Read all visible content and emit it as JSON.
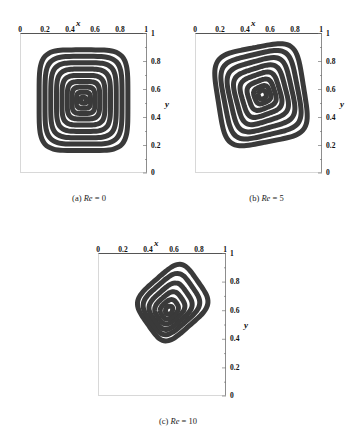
{
  "figure": {
    "panels": [
      {
        "id": "a",
        "caption_prefix": "(a)",
        "caption_symbol": "Re",
        "caption_value": "= 0",
        "caption_full": "(a) Re = 0",
        "x_axis_label": "x",
        "y_axis_label": "y",
        "x_ticks": [
          "0",
          "0.2",
          "0.4",
          "0.6",
          "0.8",
          "1"
        ],
        "y_ticks": [
          "1",
          "0.8",
          "0.6",
          "0.4",
          "0.2",
          "0"
        ]
      },
      {
        "id": "b",
        "caption_prefix": "(b)",
        "caption_symbol": "Re",
        "caption_value": "= 5",
        "caption_full": "(b) Re = 5",
        "x_axis_label": "x",
        "y_axis_label": "y",
        "x_ticks": [
          "0",
          "0.2",
          "0.4",
          "0.6",
          "0.8",
          "1"
        ],
        "y_ticks": [
          "1",
          "0.8",
          "0.6",
          "0.4",
          "0.2",
          "0"
        ]
      },
      {
        "id": "c",
        "caption_prefix": "(c)",
        "caption_symbol": "Re",
        "caption_value": "= 10",
        "caption_full": "(c) Re = 10",
        "x_axis_label": "x",
        "y_axis_label": "y",
        "x_ticks": [
          "0",
          "0.2",
          "0.4",
          "0.6",
          "0.8",
          "1"
        ],
        "y_ticks": [
          "1",
          "0.8",
          "0.6",
          "0.4",
          "0.2",
          "0"
        ]
      }
    ]
  },
  "chart_data": [
    {
      "type": "contour",
      "title": "(a) Re = 0",
      "xlabel": "x",
      "ylabel": "y",
      "xlim": [
        0,
        1
      ],
      "ylim": [
        0,
        1
      ],
      "xticks": [
        0,
        0.2,
        0.4,
        0.6,
        0.8,
        1
      ],
      "yticks": [
        0,
        0.2,
        0.4,
        0.6,
        0.8,
        1
      ],
      "grid": false,
      "legend": "none",
      "vortex_center": [
        0.5,
        0.52
      ],
      "n_contours": 9,
      "contours": [
        {
          "level": 1,
          "cx": 0.5,
          "cy": 0.52,
          "rx": 0.355,
          "ry": 0.365,
          "rot": 0,
          "squareness": 0.74
        },
        {
          "level": 2,
          "cx": 0.5,
          "cy": 0.52,
          "rx": 0.308,
          "ry": 0.318,
          "rot": 0,
          "squareness": 0.7
        },
        {
          "level": 3,
          "cx": 0.5,
          "cy": 0.52,
          "rx": 0.262,
          "ry": 0.272,
          "rot": 0,
          "squareness": 0.66
        },
        {
          "level": 4,
          "cx": 0.5,
          "cy": 0.52,
          "rx": 0.216,
          "ry": 0.226,
          "rot": 0,
          "squareness": 0.62
        },
        {
          "level": 5,
          "cx": 0.5,
          "cy": 0.52,
          "rx": 0.172,
          "ry": 0.18,
          "rot": 0,
          "squareness": 0.58
        },
        {
          "level": 6,
          "cx": 0.5,
          "cy": 0.52,
          "rx": 0.13,
          "ry": 0.136,
          "rot": 0,
          "squareness": 0.54
        },
        {
          "level": 7,
          "cx": 0.5,
          "cy": 0.52,
          "rx": 0.092,
          "ry": 0.096,
          "rot": 0,
          "squareness": 0.5
        },
        {
          "level": 8,
          "cx": 0.5,
          "cy": 0.52,
          "rx": 0.056,
          "ry": 0.058,
          "rot": 0,
          "squareness": 0.44
        },
        {
          "level": 9,
          "cx": 0.5,
          "cy": 0.52,
          "rx": 0.024,
          "ry": 0.026,
          "rot": 45,
          "squareness": 0.0
        }
      ]
    },
    {
      "type": "contour",
      "title": "(b) Re = 5",
      "xlabel": "x",
      "ylabel": "y",
      "xlim": [
        0,
        1
      ],
      "ylim": [
        0,
        1
      ],
      "xticks": [
        0,
        0.2,
        0.4,
        0.6,
        0.8,
        1
      ],
      "yticks": [
        0,
        0.2,
        0.4,
        0.6,
        0.8,
        1
      ],
      "grid": false,
      "legend": "none",
      "vortex_center": [
        0.53,
        0.56
      ],
      "n_contours": 8,
      "contours": [
        {
          "level": 1,
          "cx": 0.52,
          "cy": 0.56,
          "rx": 0.345,
          "ry": 0.345,
          "rot": 10,
          "squareness": 0.72
        },
        {
          "level": 2,
          "cx": 0.52,
          "cy": 0.56,
          "rx": 0.296,
          "ry": 0.296,
          "rot": 12,
          "squareness": 0.68
        },
        {
          "level": 3,
          "cx": 0.52,
          "cy": 0.56,
          "rx": 0.248,
          "ry": 0.246,
          "rot": 14,
          "squareness": 0.63
        },
        {
          "level": 4,
          "cx": 0.52,
          "cy": 0.56,
          "rx": 0.2,
          "ry": 0.196,
          "rot": 16,
          "squareness": 0.58
        },
        {
          "level": 5,
          "cx": 0.52,
          "cy": 0.56,
          "rx": 0.152,
          "ry": 0.148,
          "rot": 18,
          "squareness": 0.52
        },
        {
          "level": 6,
          "cx": 0.525,
          "cy": 0.56,
          "rx": 0.106,
          "ry": 0.102,
          "rot": 20,
          "squareness": 0.44
        },
        {
          "level": 7,
          "cx": 0.53,
          "cy": 0.56,
          "rx": 0.064,
          "ry": 0.06,
          "rot": 22,
          "squareness": 0.32
        },
        {
          "level": 8,
          "cx": 0.53,
          "cy": 0.56,
          "rx": 0.032,
          "ry": 0.03,
          "rot": 25,
          "squareness": 0.12
        }
      ]
    },
    {
      "type": "contour",
      "title": "(c) Re = 10",
      "xlabel": "x",
      "ylabel": "y",
      "xlim": [
        0,
        1
      ],
      "ylim": [
        0,
        1
      ],
      "xticks": [
        0,
        0.2,
        0.4,
        0.6,
        0.8,
        1
      ],
      "yticks": [
        0,
        0.2,
        0.4,
        0.6,
        0.8,
        1
      ],
      "grid": false,
      "legend": "none",
      "vortex_center": [
        0.56,
        0.6
      ],
      "n_contours": 6,
      "contours": [
        {
          "level": 1,
          "cx": 0.585,
          "cy": 0.655,
          "rx": 0.25,
          "ry": 0.21,
          "rot": 38,
          "squareness": 0.58
        },
        {
          "level": 2,
          "cx": 0.575,
          "cy": 0.645,
          "rx": 0.205,
          "ry": 0.168,
          "rot": 38,
          "squareness": 0.5
        },
        {
          "level": 3,
          "cx": 0.568,
          "cy": 0.63,
          "rx": 0.16,
          "ry": 0.128,
          "rot": 38,
          "squareness": 0.42
        },
        {
          "level": 4,
          "cx": 0.562,
          "cy": 0.618,
          "rx": 0.115,
          "ry": 0.09,
          "rot": 38,
          "squareness": 0.32
        },
        {
          "level": 5,
          "cx": 0.558,
          "cy": 0.608,
          "rx": 0.072,
          "ry": 0.056,
          "rot": 38,
          "squareness": 0.2
        },
        {
          "level": 6,
          "cx": 0.556,
          "cy": 0.602,
          "rx": 0.034,
          "ry": 0.028,
          "rot": 38,
          "squareness": 0.05
        }
      ]
    }
  ]
}
